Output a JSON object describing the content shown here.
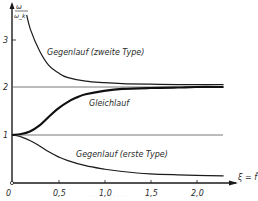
{
  "chart_data": {
    "type": "line",
    "title": "",
    "xlabel": "ξ = f̄",
    "ylabel": "ω/ω_k",
    "xlim": [
      0,
      2.4
    ],
    "ylim": [
      0,
      3.8
    ],
    "x_ticks": [
      "0",
      "0,5",
      "1,0",
      "1,5",
      "2,0"
    ],
    "y_ticks": [
      "1",
      "2",
      "3"
    ],
    "grid": false,
    "reference_lines": [
      {
        "y": 1,
        "x_range": [
          0,
          2.3
        ]
      },
      {
        "y": 2,
        "x_range": [
          0,
          2.3
        ]
      }
    ],
    "series": [
      {
        "name": "Gegenlauf (zweite Type)",
        "x": [
          0.16,
          0.2,
          0.3,
          0.4,
          0.5,
          0.6,
          0.8,
          1.0,
          1.2,
          1.5,
          1.8,
          2.0,
          2.3
        ],
        "y": [
          3.5,
          3.2,
          2.75,
          2.45,
          2.3,
          2.2,
          2.12,
          2.09,
          2.07,
          2.06,
          2.05,
          2.05,
          2.05
        ]
      },
      {
        "name": "Gleichlauf",
        "x": [
          0,
          0.1,
          0.2,
          0.3,
          0.4,
          0.5,
          0.6,
          0.7,
          0.8,
          1.0,
          1.2,
          1.5,
          1.8,
          2.0,
          2.3
        ],
        "y": [
          1.0,
          1.02,
          1.08,
          1.2,
          1.38,
          1.55,
          1.68,
          1.78,
          1.85,
          1.92,
          1.96,
          1.98,
          1.99,
          2.0,
          2.0
        ]
      },
      {
        "name": "Gegenlauf (erste Type)",
        "x": [
          0,
          0.1,
          0.2,
          0.3,
          0.4,
          0.5,
          0.6,
          0.8,
          1.0,
          1.2,
          1.5,
          1.8,
          2.0,
          2.3
        ],
        "y": [
          1.0,
          0.96,
          0.88,
          0.77,
          0.65,
          0.55,
          0.47,
          0.36,
          0.29,
          0.24,
          0.19,
          0.17,
          0.16,
          0.15
        ]
      }
    ],
    "annotations": [
      {
        "text": "Gegenlauf (zweite Type)",
        "x": 0.55,
        "y": 2.95
      },
      {
        "text": "Gleichlauf",
        "x": 0.95,
        "y": 1.72
      },
      {
        "text": "Gegenlauf (erste Type)",
        "x": 0.8,
        "y": 0.55
      }
    ]
  },
  "axes": {
    "y_label_num": "ω",
    "y_label_den": "ω_k",
    "x_label": "ξ = f̄",
    "origin_label": "0"
  },
  "caption": "· · · · · · · · · ·"
}
